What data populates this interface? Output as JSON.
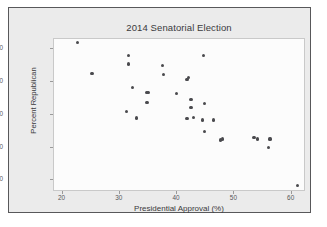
{
  "chart_data": {
    "type": "scatter",
    "title": "2014 Senatorial Election",
    "xlabel": "Presidential Approval (%)",
    "ylabel": "Percent Republican",
    "xlim": [
      18.5,
      62.5
    ],
    "ylim": [
      26.5,
      73.0
    ],
    "xticks": [
      20,
      30,
      40,
      50,
      60
    ],
    "yticks": [
      30,
      40,
      50,
      60,
      70
    ],
    "grid": false,
    "legend": null,
    "marker": {
      "shape": "circle",
      "color": "#4a4a4e",
      "size": 3.2
    },
    "series": [
      {
        "name": "States",
        "points": [
          {
            "x": 22.8,
            "y": 71.6
          },
          {
            "x": 25.3,
            "y": 62.3
          },
          {
            "x": 31.7,
            "y": 67.7
          },
          {
            "x": 31.7,
            "y": 65.1
          },
          {
            "x": 31.4,
            "y": 50.6
          },
          {
            "x": 32.4,
            "y": 58.0
          },
          {
            "x": 33.1,
            "y": 48.7
          },
          {
            "x": 34.8,
            "y": 56.5
          },
          {
            "x": 35.1,
            "y": 56.4
          },
          {
            "x": 34.9,
            "y": 53.4
          },
          {
            "x": 37.6,
            "y": 64.6
          },
          {
            "x": 37.8,
            "y": 61.9
          },
          {
            "x": 40.1,
            "y": 56.1
          },
          {
            "x": 41.9,
            "y": 60.5
          },
          {
            "x": 42.2,
            "y": 60.9
          },
          {
            "x": 42.6,
            "y": 54.3
          },
          {
            "x": 42.6,
            "y": 52.0
          },
          {
            "x": 41.9,
            "y": 48.5
          },
          {
            "x": 43.0,
            "y": 48.8
          },
          {
            "x": 44.8,
            "y": 67.7
          },
          {
            "x": 44.9,
            "y": 53.0
          },
          {
            "x": 44.6,
            "y": 48.1
          },
          {
            "x": 44.9,
            "y": 44.5
          },
          {
            "x": 46.5,
            "y": 48.1
          },
          {
            "x": 47.7,
            "y": 42.0
          },
          {
            "x": 48.1,
            "y": 42.3
          },
          {
            "x": 53.6,
            "y": 42.8
          },
          {
            "x": 54.2,
            "y": 42.3
          },
          {
            "x": 56.4,
            "y": 42.3
          },
          {
            "x": 56.1,
            "y": 39.7
          },
          {
            "x": 61.2,
            "y": 28.2
          }
        ]
      }
    ]
  }
}
